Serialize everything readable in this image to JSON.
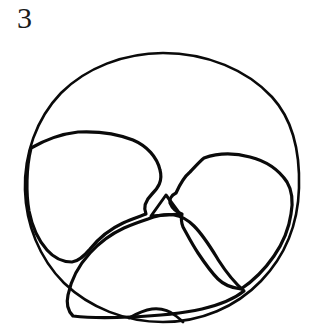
{
  "figure": {
    "label": "3",
    "caption_number": "3",
    "type": "scientific-line-drawing",
    "view": "umbilical / apertural view",
    "background_color": "#ffffff",
    "ink_color": "#0a0a0a",
    "canvas": {
      "width": 315,
      "height": 333
    }
  },
  "drawing": {
    "stroke_widths": {
      "outer_test": 2.6,
      "chamber": 3.2,
      "suture": 3.0,
      "aperture": 2.8
    },
    "outer_test": {
      "name": "outer test periphery",
      "center": {
        "x": 163,
        "y": 188
      },
      "radius_x": 137,
      "radius_y": 135,
      "extents": {
        "top": 53,
        "bottom": 322,
        "left": 25,
        "right": 299
      }
    },
    "chambers": [
      {
        "name": "left chamber",
        "position": "left",
        "crest": {
          "x": 92,
          "y": 134
        },
        "extent": {
          "left": 30,
          "right": 160,
          "top": 132,
          "bottom": 262
        }
      },
      {
        "name": "right chamber",
        "position": "right",
        "crest": {
          "x": 218,
          "y": 156
        },
        "extent": {
          "left": 163,
          "right": 292,
          "top": 154,
          "bottom": 290
        }
      },
      {
        "name": "final chamber",
        "position": "bottom",
        "crest": {
          "x": 132,
          "y": 236
        },
        "extent": {
          "left": 58,
          "right": 248,
          "top": 215,
          "bottom": 318
        }
      }
    ],
    "junction": {
      "name": "central umbilical junction",
      "shape": "triangular",
      "vertices": [
        {
          "x": 166,
          "y": 195
        },
        {
          "x": 151,
          "y": 216
        },
        {
          "x": 180,
          "y": 214
        }
      ]
    },
    "aperture": {
      "name": "basal aperture arch",
      "x": 152,
      "y": 314,
      "width": 46,
      "height": 12
    },
    "paths": {
      "outer_test": "M 163 53 C 207 53 247 70 272 97 C 294 121 300 155 299 188 C 298 224 285 256 261 281 C 236 307 201 322 163 322 C 126 322 90 308 64 283 C 39 258 26 224 25 190 C 24 155 36 119 61 93 C 86 68 124 53 163 53 Z",
      "left_chamber": "M 31 148 C 45 140 60 134 78 132 C 98 131 118 134 133 140 C 147 146 157 157 160 170 C 163 181 158 188 152 194 C 146 200 143 207 146 214 C 141 216 131 219 123 223 C 110 229 99 238 90 249 C 84 256 79 261 72 262 C 63 262 54 258 47 250 C 38 240 32 226 29 211 C 26 194 26 168 31 148 Z",
      "right_chamber": "M 176 193 C 180 184 184 177 190 172 C 195 167 199 162 204 158 C 218 153 235 153 250 157 C 266 161 279 170 287 182 C 293 192 293 203 291 214 C 289 228 283 243 274 256 C 265 269 253 281 241 289 C 232 288 224 285 218 279 C 210 271 204 262 198 253 C 192 244 188 236 183 227 C 181 222 181 218 182 214 C 176 212 172 208 170 203 C 169 199 172 195 176 193 Z",
      "final_chamber": "M 148 219 C 142 221 133 224 124 228 C 111 234 99 243 90 253 C 79 265 71 280 68 295 C 66 304 68 311 73 316 C 89 318 110 318 130 317 C 155 316 180 314 202 309 C 219 305 234 299 244 291 C 235 283 226 272 219 261 C 211 248 204 236 194 226 C 188 220 181 216 174 215 C 166 214 156 216 148 219 Z",
      "junction_triangle": "M 166 195 L 151 216 L 180 214 Z",
      "aperture_arch": "M 129 318 C 136 314 144 310 152 309 C 161 308 170 311 176 316 C 180 319 182 321 183 322"
    }
  }
}
